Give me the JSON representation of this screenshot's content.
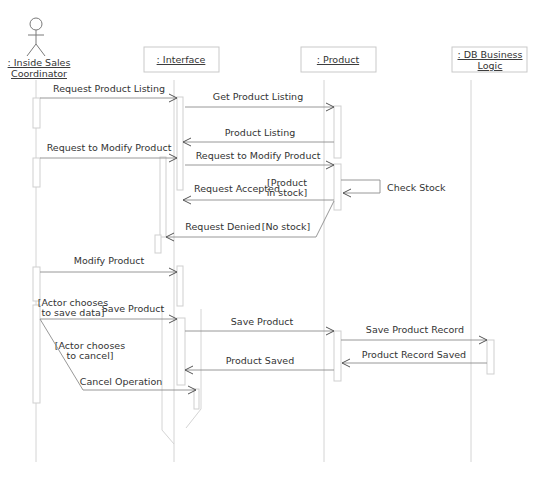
{
  "diagram": {
    "type": "uml-sequence-diagram",
    "participants": [
      {
        "id": "actor",
        "kind": "actor",
        "label_lines": [
          ": Inside Sales",
          "Coordinator"
        ],
        "x": 36
      },
      {
        "id": "interface",
        "kind": "object",
        "label_lines": [
          ": Interface"
        ],
        "x": 181
      },
      {
        "id": "product",
        "kind": "object",
        "label_lines": [
          ": Product"
        ],
        "x": 338
      },
      {
        "id": "db",
        "kind": "object",
        "label_lines": [
          ": DB Business",
          "Logic"
        ],
        "x": 490
      }
    ],
    "messages": [
      {
        "label": "Request Product Listing",
        "from": "actor",
        "to": "interface",
        "y": 98
      },
      {
        "label": "Get Product Listing",
        "from": "interface",
        "to": "product",
        "y": 107
      },
      {
        "label": "Product Listing",
        "from": "product",
        "to": "interface",
        "y": 142
      },
      {
        "label": "Request to Modify Product",
        "from": "actor",
        "to": "interface",
        "y": 158
      },
      {
        "label": "Request to Modify Product",
        "from": "interface",
        "to": "product",
        "y": 165
      },
      {
        "label": "Check Stock",
        "from": "product",
        "to": "product",
        "y": 180,
        "self": true
      },
      {
        "label": "Request Accepted",
        "guard": [
          "[Product",
          "in stock]"
        ],
        "from": "product",
        "to": "interface",
        "y": 199
      },
      {
        "label": "Request Denied",
        "guard": [
          "[No stock]"
        ],
        "from": "product",
        "to": "interface-inner",
        "y": 237
      },
      {
        "label": "Modify Product",
        "from": "actor",
        "to": "interface",
        "y": 272
      },
      {
        "label": "Save Product",
        "guard": [
          "[Actor chooses",
          "to save data]"
        ],
        "from": "actor",
        "to": "interface",
        "y": 319
      },
      {
        "label": "Save Product",
        "from": "interface",
        "to": "product",
        "y": 331
      },
      {
        "label": "Save Product Record",
        "from": "product",
        "to": "db",
        "y": 340
      },
      {
        "label": "Product Record Saved",
        "from": "db",
        "to": "product",
        "y": 363
      },
      {
        "label": "Product Saved",
        "from": "product",
        "to": "interface",
        "y": 370
      },
      {
        "label": "Cancel Operation",
        "guard": [
          "[Actor chooses",
          "to cancel]"
        ],
        "from": "actor",
        "to": "interface-branch",
        "y": 390
      }
    ],
    "text": {
      "actor_line1": ": Inside Sales",
      "actor_line2": "Coordinator",
      "interface": ": Interface",
      "product": ": Product",
      "db_line1": ": DB Business",
      "db_line2": "Logic",
      "m1": "Request Product Listing",
      "m2": "Get Product Listing",
      "m3": "Product Listing",
      "m4": "Request to Modify Product",
      "m5": "Request to Modify Product",
      "m6": "Check Stock",
      "m7": "Request Accepted",
      "g7a": "[Product",
      "g7b": "in stock]",
      "m8": "Request Denied",
      "g8": "[No stock]",
      "m9": "Modify Product",
      "m10": "Save Product",
      "g10a": "[Actor chooses",
      "g10b": "to save data]",
      "m11": "Save Product",
      "m12": "Save Product Record",
      "m13": "Product Record Saved",
      "m14": "Product Saved",
      "m15": "Cancel Operation",
      "g15a": "[Actor chooses",
      "g15b": "to cancel]"
    }
  }
}
